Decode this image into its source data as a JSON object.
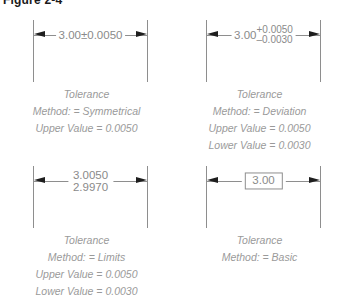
{
  "figure": {
    "title": "Figure 2-4"
  },
  "colors": {
    "background": "#ffffff",
    "line": "#8e8e8e",
    "arrow": "#1e1e1e",
    "dimension_text": "#8a8a8a",
    "caption_text": "#9a9a9a",
    "title_text": "#1a1a1a"
  },
  "examples": [
    {
      "id": "symmetrical",
      "dimension": {
        "style": "symmetrical",
        "nominal": "3.00",
        "plusminus": "±0.0050",
        "display": "3.00±0.0050"
      },
      "caption": {
        "heading": "Tolerance",
        "method": "Method: = Symmetrical",
        "upper": "Upper Value =  0.0050",
        "lower": ""
      }
    },
    {
      "id": "deviation",
      "dimension": {
        "style": "deviation",
        "nominal": "3.00",
        "upper_dev": "+0.0050",
        "lower_dev": "–0.0030",
        "display": "3.00 +0.0050 / –0.0030"
      },
      "caption": {
        "heading": "Tolerance",
        "method": "Method: = Deviation",
        "upper": "Upper Value =  0.0050",
        "lower": "Lower Value =  0.0030"
      }
    },
    {
      "id": "limits",
      "dimension": {
        "style": "limits",
        "upper_limit": "3.0050",
        "lower_limit": "2.9970",
        "display": "3.0050 / 2.9970"
      },
      "caption": {
        "heading": "Tolerance",
        "method": "Method: = Limits",
        "upper": "Upper Value =  0.0050",
        "lower": "Lower Value =  0.0030"
      }
    },
    {
      "id": "basic",
      "dimension": {
        "style": "basic",
        "nominal": "3.00",
        "display": "3.00"
      },
      "caption": {
        "heading": "Tolerance",
        "method": "Method: = Basic",
        "upper": "",
        "lower": ""
      }
    }
  ]
}
